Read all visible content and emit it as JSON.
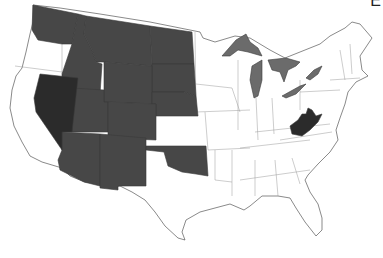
{
  "corner_label": "E",
  "legend_colors": {
    "shaded": "#474747",
    "dark": "#2b2b2b",
    "lakes": "#6b6b6b",
    "unshaded": "#ffffff",
    "outline": "#3a3a3a"
  },
  "map": {
    "region": "Contiguous United States",
    "states": [
      {
        "id": "WA",
        "name": "Washington",
        "category": "shaded"
      },
      {
        "id": "OR",
        "name": "Oregon",
        "category": "unshaded"
      },
      {
        "id": "CA",
        "name": "California",
        "category": "unshaded"
      },
      {
        "id": "NV",
        "name": "Nevada",
        "category": "dark"
      },
      {
        "id": "ID",
        "name": "Idaho",
        "category": "shaded"
      },
      {
        "id": "MT",
        "name": "Montana",
        "category": "shaded"
      },
      {
        "id": "WY",
        "name": "Wyoming",
        "category": "shaded"
      },
      {
        "id": "UT",
        "name": "Utah",
        "category": "shaded"
      },
      {
        "id": "AZ",
        "name": "Arizona",
        "category": "shaded"
      },
      {
        "id": "CO",
        "name": "Colorado",
        "category": "shaded"
      },
      {
        "id": "NM",
        "name": "New Mexico",
        "category": "shaded"
      },
      {
        "id": "ND",
        "name": "North Dakota",
        "category": "shaded"
      },
      {
        "id": "SD",
        "name": "South Dakota",
        "category": "shaded"
      },
      {
        "id": "NE",
        "name": "Nebraska",
        "category": "shaded"
      },
      {
        "id": "KS",
        "name": "Kansas",
        "category": "unshaded"
      },
      {
        "id": "OK",
        "name": "Oklahoma",
        "category": "shaded"
      },
      {
        "id": "TX",
        "name": "Texas",
        "category": "unshaded"
      },
      {
        "id": "WV",
        "name": "West Virginia",
        "category": "dark"
      }
    ],
    "features": [
      {
        "id": "great-lakes",
        "name": "Great Lakes",
        "category": "lakes"
      }
    ]
  }
}
